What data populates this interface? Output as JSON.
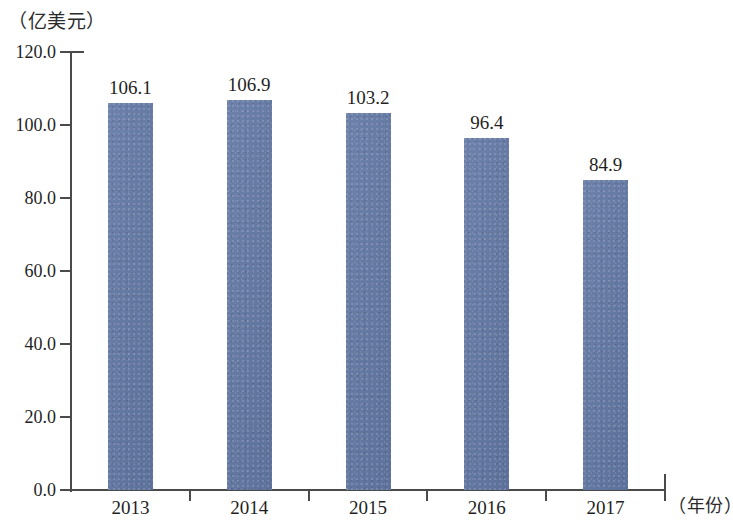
{
  "chart_data": {
    "type": "bar",
    "title": "",
    "subtitle": "",
    "xlabel": "（年份）",
    "ylabel": "（亿美元）",
    "categories": [
      "2013",
      "2014",
      "2015",
      "2016",
      "2017"
    ],
    "values": [
      106.1,
      106.9,
      103.2,
      96.4,
      84.9
    ],
    "value_labels": [
      "106.1",
      "106.9",
      "103.2",
      "96.4",
      "84.9"
    ],
    "ylim": [
      0,
      120
    ],
    "ytick_step": 20,
    "ytick_labels": [
      "120.0",
      "100.0",
      "80.0",
      "60.0",
      "40.0",
      "20.0",
      "0.0"
    ],
    "ytick_values": [
      120,
      100,
      80,
      60,
      40,
      20,
      0
    ],
    "grid": false,
    "legend": null,
    "series": [
      {
        "name": "",
        "values": [
          106.1,
          106.9,
          103.2,
          96.4,
          84.9
        ],
        "color": "#6278a4"
      }
    ]
  },
  "axes": {
    "y_unit_caption": "（亿美元）",
    "x_unit_caption": "（年份）",
    "axis_color": "#4a4a4a"
  },
  "colors": {
    "bar_fill": "#6278a4",
    "axis": "#4a4a4a",
    "text": "#1f1f1f",
    "background": "#ffffff"
  }
}
